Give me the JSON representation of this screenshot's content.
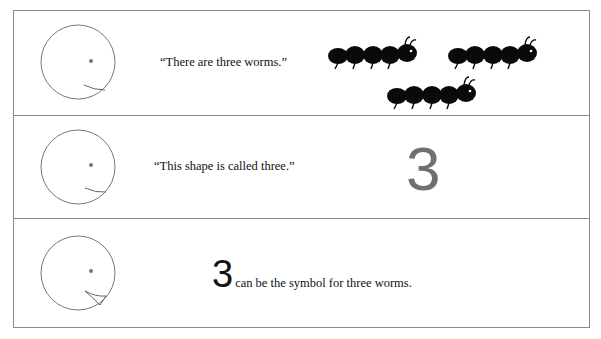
{
  "panels": [
    {
      "speech": "“There are three worms.”",
      "illustration": "three-worms",
      "worm_count": 3
    },
    {
      "speech": "“This shape is called three.”",
      "numeral": "3",
      "numeral_color": "#707070"
    },
    {
      "numeral": "3",
      "caption": "can be the symbol for three worms."
    }
  ],
  "icons": {
    "face": "face-icon",
    "worm": "worm-icon"
  }
}
